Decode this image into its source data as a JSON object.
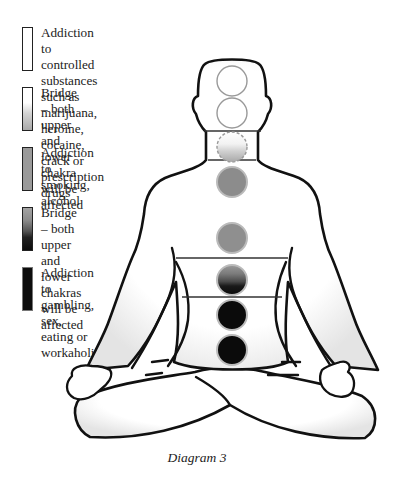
{
  "legend": {
    "items": [
      {
        "text": "Addiction to controlled substances\nsuch as marijuana, heroine, cocaine,\ncrack or prescription drugs",
        "swatch": "white",
        "top": 27
      },
      {
        "text": "Bridge – both upper and\nlower chakra will be\naffected",
        "swatch": "white-to-light-gray",
        "top": 87
      },
      {
        "text": "Addiction to\nsmoking, alcohol",
        "swatch": "medium-gray",
        "top": 147
      },
      {
        "text": "Bridge – both upper\nand lower chakras\nwill be affected",
        "swatch": "gray-to-black",
        "top": 207
      },
      {
        "text": "Addiction to\ngambling, sex,\neating or\nworkaholic",
        "swatch": "black",
        "top": 267
      }
    ]
  },
  "figure": {
    "chakras": [
      {
        "name": "crown",
        "fill": "white",
        "cy": 81
      },
      {
        "name": "third-eye",
        "fill": "white",
        "cy": 113
      },
      {
        "name": "throat-bridge",
        "fill": "white-to-light-gray",
        "cy": 148,
        "dashed": true
      },
      {
        "name": "heart-upper",
        "fill": "medium-gray",
        "cy": 182
      },
      {
        "name": "heart",
        "fill": "medium-gray",
        "cy": 238
      },
      {
        "name": "solar-plexus-bridge",
        "fill": "gray-to-black",
        "cy": 281
      },
      {
        "name": "sacral",
        "fill": "black",
        "cy": 315
      },
      {
        "name": "root",
        "fill": "black",
        "cy": 350
      }
    ],
    "colors": {
      "white": "#ffffff",
      "light_gray": "#c8c8c8",
      "medium_gray": "#8a8a8a",
      "dark_gray": "#4a4a4a",
      "black": "#0d0d0d",
      "outline": "#111111"
    }
  },
  "caption": "Diagram 3"
}
